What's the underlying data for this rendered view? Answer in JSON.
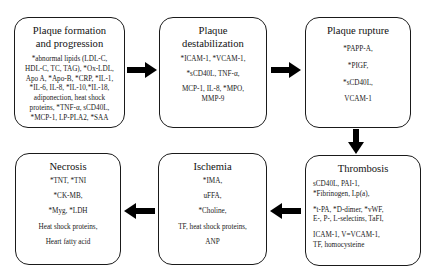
{
  "diagram": {
    "type": "flowchart",
    "arrow_color": "#000000",
    "border_color": "#1a1a1a",
    "stages": [
      {
        "id": "plaque-formation",
        "title_lines": [
          "Plaque formation",
          "and progression"
        ],
        "lines": [
          "*abnormal lipids (LDL-C,",
          "HDL-C, TC, TAG), *Ox-LDL,",
          "Apo A, *Apo-B, *CRP, *IL-1,",
          "*IL-6, IL-8, *IL-10,*IL-18,",
          "adiponection, heat shock",
          "proteins, *TNF-α, sCD40L,",
          "*MCP-1, LP-PLA2, *SAA"
        ]
      },
      {
        "id": "plaque-destabilization",
        "title_lines": [
          "Plaque",
          "destabilization"
        ],
        "lines": [
          "*ICAM-1, *VCAM-1,",
          "*sCD40L, TNF-α,",
          "MCP-1, IL-8, *MPO,",
          "MMP-9"
        ]
      },
      {
        "id": "plaque-rupture",
        "title_lines": [
          "Plaque rupture"
        ],
        "lines": [
          "*PAPP-A,",
          "*PIGF,",
          "*sCD40L,",
          "VCAM-1"
        ]
      },
      {
        "id": "thrombosis",
        "title_lines": [
          "Thrombosis"
        ],
        "groups": [
          [
            "sCD40L, PAI-1,",
            "*Fibrinogen, Lp(a),"
          ],
          [
            "*t-PA, *D-dimer, *vWF,",
            "E-, P-, L-selectins, TaFI,"
          ],
          [
            "ICAM-1, V=VCAM-1,",
            "TF, homocysteine"
          ]
        ]
      },
      {
        "id": "ischemia",
        "title_lines": [
          "Ischemia"
        ],
        "lines": [
          "*IMA,",
          "uFFA,",
          "*Choline,",
          "TF, heat shock proteins,",
          "ANP"
        ]
      },
      {
        "id": "necrosis",
        "title_lines": [
          "Necrosis"
        ],
        "lines": [
          "*TNT, *TNI",
          "*CK-MB,",
          "*Myg, *LDH",
          "Heat shock proteins,",
          "Heart fatty acid"
        ]
      }
    ],
    "arrows": [
      {
        "from": "plaque-formation",
        "to": "plaque-destabilization",
        "direction": "right"
      },
      {
        "from": "plaque-destabilization",
        "to": "plaque-rupture",
        "direction": "right"
      },
      {
        "from": "plaque-rupture",
        "to": "thrombosis",
        "direction": "down"
      },
      {
        "from": "thrombosis",
        "to": "ischemia",
        "direction": "left"
      },
      {
        "from": "ischemia",
        "to": "necrosis",
        "direction": "left"
      }
    ]
  }
}
